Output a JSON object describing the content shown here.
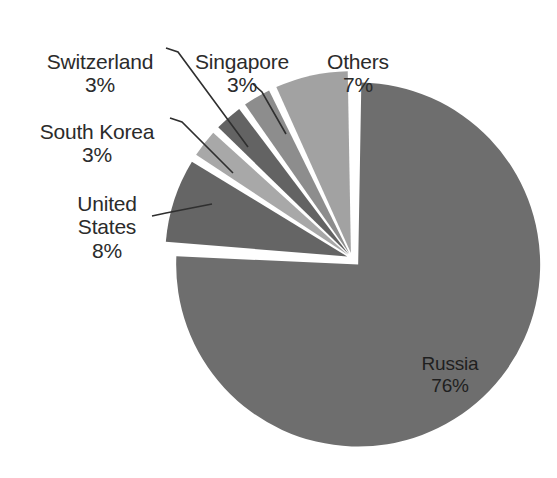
{
  "chart_data": {
    "type": "pie",
    "title": "",
    "subtitle": "",
    "xlabel": "",
    "ylabel": "",
    "legend_position": "none",
    "grid": false,
    "exploded": true,
    "label_format": "name + percent",
    "start_angle_deg": 0,
    "direction": "clockwise-for-largest, counterclockwise fan for small slices",
    "categories": [
      "Russia",
      "Others",
      "Singapore",
      "Switzerland",
      "South Korea",
      "United States"
    ],
    "values": [
      76,
      7,
      3,
      3,
      3,
      8
    ],
    "unit": "%",
    "slices": [
      {
        "name": "Russia",
        "value": 76,
        "percent_label": "76%",
        "color": "#6e6e6e",
        "label_placement": "inside",
        "label_lines": [
          "Russia",
          "76%"
        ]
      },
      {
        "name": "Others",
        "value": 7,
        "percent_label": "7%",
        "color": "#a2a2a2",
        "label_placement": "outside",
        "label_lines": [
          "Others",
          "7%"
        ]
      },
      {
        "name": "Singapore",
        "value": 3,
        "percent_label": "3%",
        "color": "#8d8d8d",
        "label_placement": "outside",
        "label_lines": [
          "Singapore",
          "3%"
        ]
      },
      {
        "name": "Switzerland",
        "value": 3,
        "percent_label": "3%",
        "color": "#636363",
        "label_placement": "outside",
        "label_lines": [
          "Switzerland",
          "3%"
        ]
      },
      {
        "name": "South Korea",
        "value": 3,
        "percent_label": "3%",
        "color": "#a8a8a8",
        "label_placement": "outside",
        "label_lines": [
          "South Korea",
          "3%"
        ]
      },
      {
        "name": "United States",
        "value": 8,
        "percent_label": "8%",
        "color": "#656565",
        "label_placement": "outside",
        "label_lines": [
          "United",
          "States",
          "8%"
        ]
      }
    ]
  },
  "labels": {
    "switzerland": {
      "name": "Switzerland",
      "percent": "3%"
    },
    "south_korea": {
      "name": "South Korea",
      "percent": "3%"
    },
    "united_states": {
      "name": "United\nStates",
      "percent": "8%"
    },
    "singapore": {
      "name": "Singapore",
      "percent": "3%"
    },
    "others": {
      "name": "Others",
      "percent": "7%"
    },
    "russia": {
      "name": "Russia",
      "percent": "76%"
    }
  },
  "colors": {
    "background": "#ffffff",
    "russia": "#6e6e6e",
    "others": "#a2a2a2",
    "singapore": "#8d8d8d",
    "switzerland": "#636363",
    "south_korea": "#a8a8a8",
    "united_states": "#656565",
    "leader_line": "#2f2f2f",
    "text": "#2b2b2b"
  }
}
